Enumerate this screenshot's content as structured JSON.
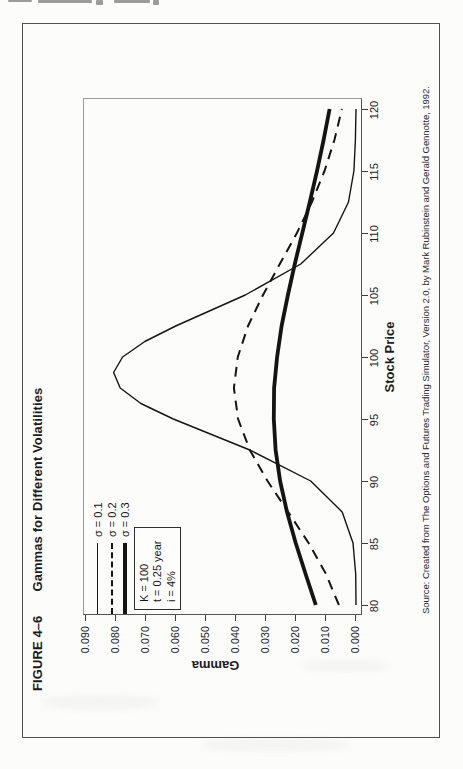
{
  "figure": {
    "label": "FIGURE 4–6",
    "title": "Gammas for Different Volatilities"
  },
  "axes": {
    "x_title": "Stock Price",
    "y_title": "Gamma",
    "x_ticks": [
      "80",
      "85",
      "90",
      "95",
      "100",
      "105",
      "110",
      "115",
      "120"
    ],
    "y_ticks": [
      "0.000",
      "0.010",
      "0.020",
      "0.030",
      "0.040",
      "0.050",
      "0.060",
      "0.070",
      "0.080",
      "0.090"
    ]
  },
  "legend": [
    {
      "label": "σ = 0.1",
      "style": "thin-solid"
    },
    {
      "label": "σ = 0.2",
      "style": "dashed"
    },
    {
      "label": "σ = 0.3",
      "style": "thick-solid"
    }
  ],
  "param_box": {
    "lines": [
      "K = 100",
      "t = 0.25 year",
      "i = 4%"
    ]
  },
  "source": "Source: Created from The Options and Futures Trading Simulator, Version 2.0, by Mark Rubinstein and Gerald Gennotte, 1992.",
  "chart_data": {
    "type": "line",
    "title": "Gammas for Different Volatilities",
    "xlabel": "Stock Price",
    "ylabel": "Gamma",
    "xlim": [
      80,
      120
    ],
    "ylim": [
      0,
      0.09
    ],
    "grid": false,
    "legend_position": "upper-left-inside",
    "orientation_on_page": "rotated 90 degrees counterclockwise",
    "parameters": {
      "K": 100,
      "t_years": 0.25,
      "i": "4%"
    },
    "series": [
      {
        "name": "σ = 0.1",
        "style": "thin-solid",
        "x": [
          80,
          82.5,
          85,
          87.5,
          90,
          92.5,
          95,
          96.25,
          97.5,
          98.75,
          100,
          101.25,
          102.5,
          105,
          107.5,
          110,
          112.5,
          115,
          117.5,
          120
        ],
        "y": [
          0.0,
          0.0001,
          0.001,
          0.0046,
          0.0151,
          0.0354,
          0.0609,
          0.0717,
          0.0786,
          0.0808,
          0.0778,
          0.0704,
          0.0601,
          0.0369,
          0.0184,
          0.0075,
          0.0025,
          0.0007,
          0.0002,
          0.0
        ]
      },
      {
        "name": "σ = 0.2",
        "style": "dashed",
        "x": [
          80,
          82.5,
          85,
          87.5,
          90,
          92.5,
          95,
          97.5,
          100,
          102.5,
          105,
          107.5,
          110,
          112.5,
          115,
          117.5,
          120
        ],
        "y": [
          0.0057,
          0.01,
          0.0158,
          0.0226,
          0.0295,
          0.0354,
          0.0393,
          0.0407,
          0.0394,
          0.036,
          0.031,
          0.0254,
          0.0197,
          0.0147,
          0.0105,
          0.0072,
          0.0047
        ]
      },
      {
        "name": "σ = 0.3",
        "style": "thick-solid",
        "x": [
          80,
          82.5,
          85,
          87.5,
          90,
          92.5,
          95,
          97.5,
          100,
          102.5,
          105,
          107.5,
          110,
          112.5,
          115,
          117.5,
          120
        ],
        "y": [
          0.0134,
          0.0168,
          0.0201,
          0.023,
          0.0253,
          0.0268,
          0.0274,
          0.0273,
          0.0263,
          0.0248,
          0.0227,
          0.0204,
          0.0179,
          0.0154,
          0.013,
          0.0108,
          0.0088
        ]
      }
    ]
  }
}
